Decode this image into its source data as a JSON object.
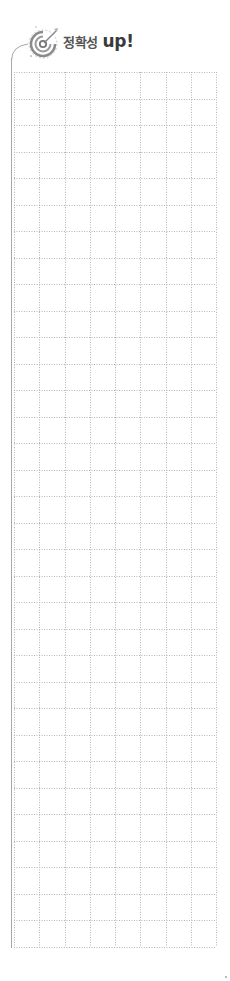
{
  "header": {
    "icon": "target-icon",
    "title_korean": "정확성",
    "title_suffix": "up!"
  },
  "grid": {
    "columns": 8,
    "rows": 33,
    "line_style": "dotted",
    "line_color": "#b5b5b5",
    "border_color": "#a8a8a8"
  },
  "colors": {
    "accent": "#8a8a8a",
    "text": "#444444"
  }
}
